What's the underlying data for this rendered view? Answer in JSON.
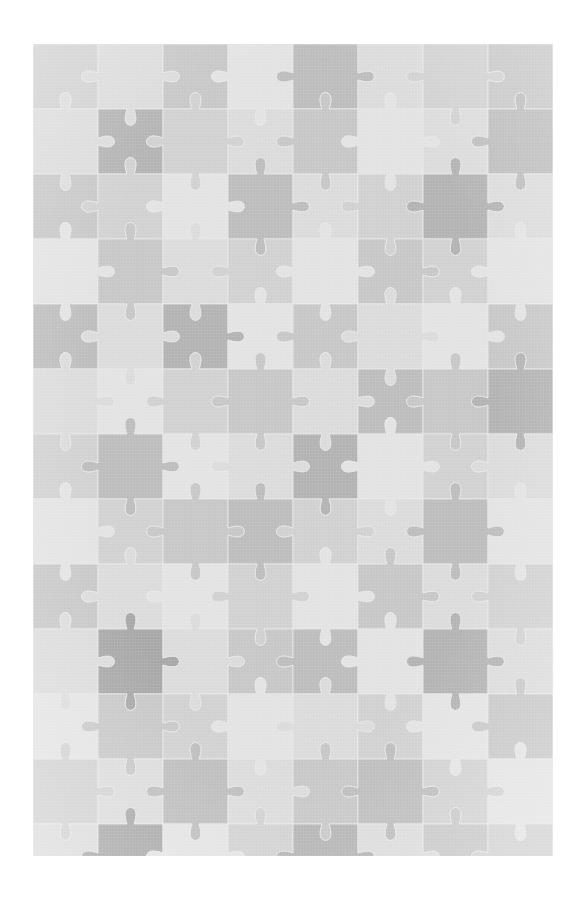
{
  "page": {
    "width": 583,
    "height": 903,
    "background_color": "#ffffff"
  },
  "puzzle": {
    "name": "jigsaw-puzzle-pattern",
    "origin_x": 33,
    "origin_y": 44,
    "width": 520,
    "height": 812,
    "piece_pitch": 65,
    "columns": 8,
    "rows": 13,
    "tab_radius": 11,
    "tab_neck": 7,
    "seam_color": "#e8e8e8",
    "seam_width": 0.9,
    "palette": {
      "lightest": "#e4e4e4",
      "light": "#dcdcdc",
      "mid_light": "#d2d2d2",
      "mid": "#c8c8c8",
      "mid_dark": "#bebebe",
      "dark": "#b4b4b4",
      "darkest": "#a9a9a9"
    },
    "shade_levels": [
      "lightest",
      "light",
      "mid_light",
      "mid",
      "mid_dark",
      "dark",
      "darkest"
    ],
    "shade_grid": [
      [
        2,
        1,
        3,
        0,
        4,
        1,
        2,
        3
      ],
      [
        1,
        5,
        2,
        1,
        3,
        0,
        1,
        4
      ],
      [
        3,
        2,
        0,
        4,
        1,
        2,
        5,
        1
      ],
      [
        0,
        3,
        1,
        2,
        0,
        3,
        2,
        0
      ],
      [
        4,
        1,
        5,
        0,
        3,
        1,
        0,
        3
      ],
      [
        1,
        0,
        2,
        3,
        1,
        4,
        3,
        5
      ],
      [
        2,
        4,
        0,
        1,
        5,
        0,
        2,
        1
      ],
      [
        0,
        2,
        3,
        4,
        2,
        1,
        4,
        0
      ],
      [
        3,
        1,
        0,
        2,
        0,
        3,
        1,
        2
      ],
      [
        1,
        6,
        1,
        3,
        4,
        0,
        5,
        1
      ],
      [
        0,
        3,
        2,
        0,
        1,
        2,
        0,
        3
      ],
      [
        2,
        1,
        4,
        1,
        3,
        4,
        2,
        0
      ],
      [
        1,
        6,
        0,
        2,
        5,
        1,
        3,
        2
      ]
    ],
    "horizontal_tabs": [
      [
        1,
        -1,
        1,
        1,
        -1,
        1,
        -1
      ],
      [
        -1,
        1,
        -1,
        1,
        1,
        -1,
        1
      ],
      [
        1,
        1,
        -1,
        -1,
        1,
        1,
        -1
      ],
      [
        -1,
        -1,
        1,
        1,
        -1,
        -1,
        1
      ],
      [
        1,
        -1,
        -1,
        1,
        1,
        -1,
        -1
      ],
      [
        -1,
        1,
        1,
        -1,
        -1,
        1,
        1
      ],
      [
        1,
        -1,
        1,
        -1,
        1,
        -1,
        1
      ],
      [
        -1,
        1,
        -1,
        1,
        -1,
        1,
        -1
      ],
      [
        1,
        1,
        1,
        -1,
        -1,
        -1,
        1
      ],
      [
        -1,
        -1,
        -1,
        1,
        1,
        1,
        -1
      ],
      [
        1,
        -1,
        1,
        1,
        -1,
        1,
        1
      ],
      [
        -1,
        1,
        -1,
        -1,
        1,
        -1,
        -1
      ],
      [
        1,
        1,
        -1,
        1,
        -1,
        -1,
        1
      ]
    ],
    "vertical_tabs": [
      [
        1,
        -1,
        1,
        -1,
        1,
        1,
        -1,
        1
      ],
      [
        -1,
        1,
        -1,
        1,
        -1,
        -1,
        1,
        -1
      ],
      [
        1,
        1,
        1,
        -1,
        1,
        -1,
        -1,
        1
      ],
      [
        -1,
        -1,
        -1,
        1,
        -1,
        1,
        1,
        -1
      ],
      [
        1,
        -1,
        1,
        1,
        1,
        -1,
        1,
        1
      ],
      [
        -1,
        1,
        -1,
        -1,
        -1,
        1,
        -1,
        -1
      ],
      [
        1,
        -1,
        1,
        1,
        -1,
        -1,
        1,
        1
      ],
      [
        -1,
        1,
        -1,
        -1,
        1,
        1,
        -1,
        -1
      ],
      [
        1,
        1,
        1,
        -1,
        -1,
        1,
        1,
        -1
      ],
      [
        -1,
        -1,
        -1,
        1,
        1,
        -1,
        -1,
        1
      ],
      [
        1,
        -1,
        1,
        -1,
        1,
        1,
        -1,
        1
      ],
      [
        -1,
        1,
        -1,
        1,
        -1,
        -1,
        1,
        -1
      ]
    ]
  }
}
